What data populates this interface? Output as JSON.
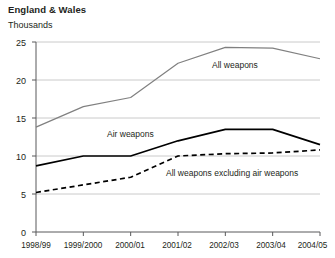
{
  "header": {
    "title": "England & Wales",
    "subtitle": "Thousands"
  },
  "chart_data": {
    "type": "line",
    "title": "England & Wales",
    "subtitle": "Thousands",
    "xlabel": "",
    "ylabel": "Thousands",
    "ylim": [
      0,
      25
    ],
    "yticks": [
      0,
      5,
      10,
      15,
      20,
      25
    ],
    "ytick_labels": [
      "0",
      "5",
      "10",
      "15",
      "20",
      "25"
    ],
    "grid": true,
    "legend_position": "inline-annotations",
    "categories": [
      "1998/99",
      "1999/2000",
      "2000/01",
      "2001/02",
      "2002/03",
      "2003/04",
      "2004/05"
    ],
    "series": [
      {
        "name": "All weapons",
        "color": "#808080",
        "style": "solid",
        "values": [
          13.8,
          16.5,
          17.7,
          22.2,
          24.3,
          24.2,
          22.8
        ]
      },
      {
        "name": "Air weapons",
        "color": "#000000",
        "style": "solid",
        "values": [
          8.7,
          10.0,
          10.0,
          12.0,
          13.5,
          13.5,
          11.5
        ]
      },
      {
        "name": "All weapons excluding air weapons",
        "color": "#000000",
        "style": "dashed",
        "values": [
          5.2,
          6.2,
          7.2,
          10.0,
          10.3,
          10.4,
          10.8
        ]
      }
    ],
    "annotations": [
      {
        "text": "All weapons",
        "x": 3.35,
        "y": 22.0
      },
      {
        "text": "Air weapons",
        "x": 1.5,
        "y": 15.2
      },
      {
        "text": "All weapons excluding air weapons",
        "x": 3.1,
        "y": 7.6
      }
    ]
  },
  "axis": {
    "y_labels": [
      "25",
      "20",
      "15",
      "10",
      "5",
      "0"
    ],
    "x_labels": [
      "1998/99",
      "1999/2000",
      "2000/01",
      "2001/02",
      "2002/03",
      "2003/04",
      "2004/05"
    ]
  },
  "annotations": {
    "all_weapons": "All weapons",
    "air_weapons": "Air weapons",
    "excluding_air": "All weapons excluding air weapons"
  }
}
